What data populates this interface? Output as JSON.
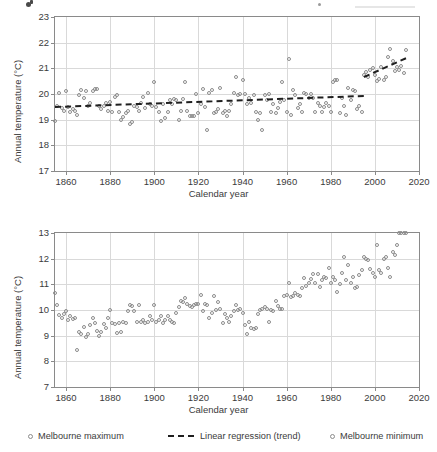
{
  "figure": {
    "axis_title_y": "Annual temperature (°C)",
    "axis_title_x": "Calendar year"
  },
  "legend": {
    "items": [
      {
        "label": "Melbourne maximum",
        "marker": "open-circle-icon"
      },
      {
        "label": "Linear regression (trend)",
        "marker": "dashed-line-icon"
      },
      {
        "label": "Melbourne minimum",
        "marker": "open-circle-icon"
      }
    ]
  },
  "chart_data": [
    {
      "type": "scatter",
      "title": "Melbourne maximum",
      "xlabel": "Calendar year",
      "ylabel": "Annual temperature (°C)",
      "xlim": [
        1855,
        2020
      ],
      "ylim": [
        17,
        23
      ],
      "xticks": [
        1860,
        1880,
        1900,
        1920,
        1940,
        1960,
        1980,
        2000,
        2020
      ],
      "yticks": [
        17,
        18,
        19,
        20,
        21,
        22,
        23
      ],
      "grid": true,
      "legend_position": "below-figure",
      "marker_color": "#8c8c8c",
      "trend_color": "#1f1f1f",
      "series": [
        {
          "name": "Melbourne maximum",
          "x": [
            1855,
            1856,
            1857,
            1858,
            1859,
            1860,
            1861,
            1862,
            1863,
            1864,
            1865,
            1866,
            1867,
            1868,
            1869,
            1870,
            1871,
            1872,
            1873,
            1874,
            1875,
            1876,
            1877,
            1878,
            1879,
            1880,
            1881,
            1882,
            1883,
            1884,
            1885,
            1886,
            1887,
            1888,
            1889,
            1890,
            1891,
            1892,
            1893,
            1894,
            1895,
            1896,
            1897,
            1898,
            1899,
            1900,
            1901,
            1902,
            1903,
            1904,
            1905,
            1906,
            1907,
            1908,
            1909,
            1910,
            1911,
            1912,
            1913,
            1914,
            1915,
            1916,
            1917,
            1918,
            1919,
            1920,
            1921,
            1922,
            1923,
            1924,
            1925,
            1926,
            1927,
            1928,
            1929,
            1930,
            1931,
            1932,
            1933,
            1934,
            1935,
            1936,
            1937,
            1938,
            1939,
            1940,
            1941,
            1942,
            1943,
            1944,
            1945,
            1946,
            1947,
            1948,
            1949,
            1950,
            1951,
            1952,
            1953,
            1954,
            1955,
            1956,
            1957,
            1958,
            1959,
            1960,
            1961,
            1962,
            1963,
            1964,
            1965,
            1966,
            1967,
            1968,
            1969,
            1970,
            1971,
            1972,
            1973,
            1974,
            1975,
            1976,
            1977,
            1978,
            1979,
            1980,
            1981,
            1982,
            1983,
            1984,
            1985,
            1986,
            1987,
            1988,
            1989,
            1990,
            1991,
            1992,
            1993,
            1994,
            1995,
            1996,
            1997,
            1998,
            1999,
            2000,
            2001,
            2002,
            2003,
            2004,
            2005,
            2006,
            2007,
            2008,
            2009,
            2010,
            2011,
            2012,
            2013,
            2014
          ],
          "y": [
            18.95,
            19.55,
            20.05,
            19.45,
            19.35,
            20.1,
            19.5,
            19.3,
            19.4,
            19.35,
            19.2,
            19.95,
            20.15,
            19.85,
            20.1,
            19.55,
            19.65,
            20.1,
            20.2,
            20.2,
            19.55,
            19.4,
            19.55,
            19.65,
            19.35,
            19.7,
            19.3,
            19.9,
            19.95,
            19.3,
            19.0,
            19.1,
            19.25,
            19.35,
            18.85,
            18.9,
            19.55,
            19.5,
            19.35,
            19.65,
            19.9,
            19.45,
            20.05,
            19.6,
            19.55,
            20.45,
            19.5,
            19.3,
            18.95,
            19.6,
            19.05,
            19.3,
            19.75,
            19.6,
            19.8,
            19.75,
            19.0,
            19.35,
            19.8,
            20.45,
            19.35,
            19.15,
            19.15,
            19.15,
            20.0,
            19.25,
            19.6,
            20.2,
            19.5,
            18.6,
            20.05,
            20.15,
            19.25,
            19.3,
            19.4,
            20.25,
            19.25,
            19.35,
            19.15,
            19.35,
            19.6,
            20.05,
            20.65,
            19.95,
            20.0,
            20.55,
            20.0,
            19.6,
            19.85,
            19.65,
            19.95,
            19.3,
            19.0,
            19.25,
            18.6,
            19.95,
            19.75,
            20.0,
            19.3,
            19.6,
            19.25,
            19.45,
            19.7,
            20.45,
            19.75,
            19.3,
            21.35,
            19.2,
            20.15,
            19.95,
            19.45,
            19.6,
            19.3,
            20.05,
            20.0,
            19.85,
            20.0,
            19.85,
            19.3,
            19.65,
            19.55,
            19.3,
            19.5,
            19.65,
            19.55,
            19.3,
            20.45,
            20.55,
            20.55,
            19.25,
            19.85,
            19.55,
            19.2,
            20.25,
            19.75,
            20.15,
            20.1,
            19.4,
            19.55,
            19.3,
            20.75,
            20.85,
            20.65,
            20.95,
            21.0,
            20.75,
            20.5,
            20.6,
            21.05,
            20.55,
            20.65,
            21.45,
            21.75,
            21.3,
            20.9,
            21.05,
            20.95,
            21.1,
            20.8,
            21.7
          ]
        }
      ],
      "trend_segments": [
        {
          "x0": 1855,
          "y0": 19.52,
          "x1": 1995,
          "y1": 19.95
        },
        {
          "x0": 1995,
          "y0": 20.72,
          "x1": 2014,
          "y1": 21.45
        }
      ]
    },
    {
      "type": "scatter",
      "title": "Melbourne minimum",
      "xlabel": "Calendar year",
      "ylabel": "Annual temperature (°C)",
      "xlim": [
        1855,
        2020
      ],
      "ylim": [
        7,
        13
      ],
      "xticks": [
        1860,
        1880,
        1900,
        1920,
        1940,
        1960,
        1980,
        2000,
        2020
      ],
      "yticks": [
        7,
        8,
        9,
        10,
        11,
        12,
        13
      ],
      "grid": true,
      "legend_position": "below-figure",
      "marker_color": "#8c8c8c",
      "series": [
        {
          "name": "Melbourne minimum",
          "x": [
            1855,
            1856,
            1857,
            1858,
            1859,
            1860,
            1861,
            1862,
            1863,
            1864,
            1865,
            1866,
            1867,
            1868,
            1869,
            1870,
            1871,
            1872,
            1873,
            1874,
            1875,
            1876,
            1877,
            1878,
            1879,
            1880,
            1881,
            1882,
            1883,
            1884,
            1885,
            1886,
            1887,
            1888,
            1889,
            1890,
            1891,
            1892,
            1893,
            1894,
            1895,
            1896,
            1897,
            1898,
            1899,
            1900,
            1901,
            1902,
            1903,
            1904,
            1905,
            1906,
            1907,
            1908,
            1909,
            1910,
            1911,
            1912,
            1913,
            1914,
            1915,
            1916,
            1917,
            1918,
            1919,
            1920,
            1921,
            1922,
            1923,
            1924,
            1925,
            1926,
            1927,
            1928,
            1929,
            1930,
            1931,
            1932,
            1933,
            1934,
            1935,
            1936,
            1937,
            1938,
            1939,
            1940,
            1941,
            1942,
            1943,
            1944,
            1945,
            1946,
            1947,
            1948,
            1949,
            1950,
            1951,
            1952,
            1953,
            1954,
            1955,
            1956,
            1957,
            1958,
            1959,
            1960,
            1961,
            1962,
            1963,
            1964,
            1965,
            1966,
            1967,
            1968,
            1969,
            1970,
            1971,
            1972,
            1973,
            1974,
            1975,
            1976,
            1977,
            1978,
            1979,
            1980,
            1981,
            1982,
            1983,
            1984,
            1985,
            1986,
            1987,
            1988,
            1989,
            1990,
            1991,
            1992,
            1993,
            1994,
            1995,
            1996,
            1997,
            1998,
            1999,
            2000,
            2001,
            2002,
            2003,
            2004,
            2005,
            2006,
            2007,
            2008,
            2009,
            2010,
            2011,
            2012,
            2013,
            2014
          ],
          "y": [
            10.65,
            10.2,
            9.8,
            9.7,
            9.85,
            9.95,
            9.6,
            9.75,
            9.65,
            9.7,
            8.45,
            9.15,
            9.05,
            9.35,
            8.95,
            9.05,
            9.4,
            9.7,
            9.5,
            9.2,
            9.0,
            9.15,
            9.45,
            9.3,
            9.7,
            10.0,
            9.5,
            9.45,
            9.1,
            9.5,
            9.15,
            9.55,
            9.5,
            9.95,
            10.2,
            10.15,
            9.95,
            9.55,
            10.2,
            9.55,
            9.6,
            9.5,
            9.55,
            9.75,
            9.6,
            10.2,
            9.55,
            9.6,
            9.75,
            9.5,
            9.6,
            9.75,
            9.6,
            9.55,
            9.5,
            9.9,
            10.1,
            10.35,
            10.3,
            10.45,
            10.25,
            10.15,
            10.1,
            10.2,
            10.25,
            10.25,
            10.6,
            9.95,
            10.25,
            10.2,
            9.7,
            9.9,
            10.55,
            10.0,
            10.3,
            10.05,
            9.5,
            9.85,
            9.7,
            9.55,
            9.75,
            9.95,
            10.2,
            10.0,
            10.05,
            9.9,
            9.4,
            9.05,
            9.55,
            9.3,
            9.25,
            9.3,
            9.85,
            10.0,
            10.05,
            10.1,
            10.05,
            9.55,
            10.0,
            9.95,
            10.35,
            10.15,
            10.05,
            10.05,
            10.55,
            10.6,
            11.05,
            10.5,
            10.55,
            10.65,
            10.6,
            10.55,
            10.85,
            11.25,
            10.95,
            11.05,
            11.2,
            11.4,
            11.05,
            11.4,
            10.9,
            11.15,
            11.3,
            11.25,
            11.65,
            11.05,
            11.3,
            11.15,
            10.7,
            11.0,
            11.45,
            12.05,
            11.15,
            11.75,
            11.05,
            11.3,
            10.85,
            10.9,
            11.35,
            11.55,
            12.05,
            12.0,
            11.95,
            11.6,
            11.45,
            11.3,
            12.55,
            11.55,
            11.45,
            12.0,
            12.05,
            11.65,
            11.3,
            12.25,
            12.15,
            12.55
          ]
        }
      ]
    }
  ]
}
